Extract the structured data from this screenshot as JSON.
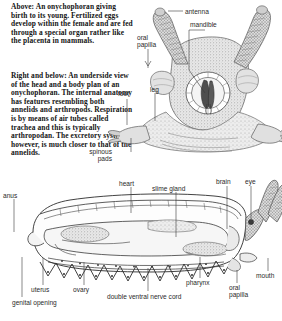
{
  "figure": {
    "background": "#ffffff",
    "ink": "#2a2a2a",
    "caption_color": "#141414"
  },
  "captions": [
    {
      "id": "cap1",
      "text": "Above: An onychophoran giving birth to its young. Fertilized eggs develop within the female and are fed through a special organ rather like the placenta in mammals."
    },
    {
      "id": "cap2",
      "text": "Right and below: An underside view of the head and a body plan of an onychophoran. The internal anatomy has features resembling both annelids and arthropods. Respiration is by means of air tubes called trachea and this is typically arthropodan. The excretory system, however, is much closer to that of the annelids."
    }
  ],
  "head_diagram": {
    "name": "onychophoran-head-underside",
    "labels": [
      {
        "key": "antenna",
        "text": "antenna",
        "x": 185,
        "y": 8,
        "align": "left"
      },
      {
        "key": "mandible",
        "text": "mandible",
        "x": 190,
        "y": 21,
        "align": "left"
      },
      {
        "key": "oral_papilla",
        "text": "oral\npapilla",
        "x": 137,
        "y": 34,
        "align": "left"
      },
      {
        "key": "foot",
        "text": "foot",
        "x": 118,
        "y": 90,
        "align": "left"
      },
      {
        "key": "leg",
        "text": "leg",
        "x": 150,
        "y": 86,
        "align": "left"
      },
      {
        "key": "spinous_pads",
        "text": "spinous\npads",
        "x": 112,
        "y": 148,
        "align": "right"
      }
    ]
  },
  "body_diagram": {
    "name": "onychophoran-body-plan",
    "labels": [
      {
        "key": "anus",
        "text": "anus",
        "x": 3,
        "y": 192,
        "align": "left"
      },
      {
        "key": "heart",
        "text": "heart",
        "x": 119,
        "y": 180,
        "align": "left"
      },
      {
        "key": "slime_gland",
        "text": "slime gland",
        "x": 152,
        "y": 185,
        "align": "left"
      },
      {
        "key": "brain",
        "text": "brain",
        "x": 218,
        "y": 178,
        "align": "left"
      },
      {
        "key": "eye",
        "text": "eye",
        "x": 247,
        "y": 178,
        "align": "left"
      },
      {
        "key": "mouth",
        "text": "mouth",
        "x": 256,
        "y": 272,
        "align": "left"
      },
      {
        "key": "oral_papilla2",
        "text": "oral\npapilla",
        "x": 229,
        "y": 284,
        "align": "left"
      },
      {
        "key": "pharynx",
        "text": "pharynx",
        "x": 186,
        "y": 279,
        "align": "left"
      },
      {
        "key": "nerve_cord",
        "text": "double ventral nerve cord",
        "x": 107,
        "y": 293,
        "align": "left"
      },
      {
        "key": "ovary",
        "text": "ovary",
        "x": 73,
        "y": 286,
        "align": "left"
      },
      {
        "key": "uterus",
        "text": "uterus",
        "x": 31,
        "y": 286,
        "align": "left"
      },
      {
        "key": "genital",
        "text": "genital opening",
        "x": 12,
        "y": 299,
        "align": "left"
      }
    ]
  }
}
